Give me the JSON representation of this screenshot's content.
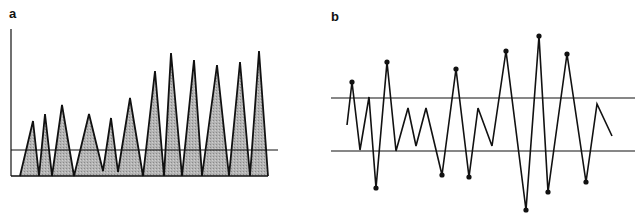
{
  "chart_data": [
    {
      "type": "area",
      "panel_label": "a",
      "title": "",
      "xlabel": "",
      "ylabel": "",
      "grid": false,
      "legend": null,
      "description": "Triangular spikes (shaded) rising from a baseline with a horizontal threshold line; amplitude grows toward the right",
      "ylim": [
        0,
        100
      ],
      "threshold": 18,
      "points": [
        [
          0,
          0
        ],
        [
          9,
          30
        ],
        [
          14,
          0
        ],
        [
          19,
          35
        ],
        [
          24,
          0
        ],
        [
          31,
          41
        ],
        [
          40,
          0
        ],
        [
          52,
          35
        ],
        [
          61,
          3
        ],
        [
          66,
          40
        ],
        [
          73,
          2
        ],
        [
          80,
          53
        ],
        [
          91,
          0
        ],
        [
          101,
          71
        ],
        [
          107,
          0
        ],
        [
          116,
          84
        ],
        [
          124,
          0
        ],
        [
          132,
          79
        ],
        [
          142,
          0
        ],
        [
          152,
          76
        ],
        [
          162,
          0
        ],
        [
          172,
          78
        ],
        [
          180,
          0
        ],
        [
          188,
          85
        ],
        [
          192,
          0
        ]
      ],
      "peaks": [
        30,
        35,
        41,
        35,
        40,
        53,
        71,
        84,
        79,
        76,
        78,
        85
      ],
      "pixel_geometry": {
        "axis_x": 11,
        "axis_top": 29,
        "baseline_y": 176,
        "threshold_y": 150,
        "threshold_x_end": 278,
        "fill_color": "#a9a9a9",
        "stroke_color": "#111111",
        "polyline": [
          [
            20,
            176
          ],
          [
            33,
            121
          ],
          [
            39,
            176
          ],
          [
            45,
            114
          ],
          [
            52,
            176
          ],
          [
            62,
            105
          ],
          [
            74,
            176
          ],
          [
            89,
            114
          ],
          [
            103,
            171
          ],
          [
            111,
            118
          ],
          [
            118,
            172
          ],
          [
            130,
            98
          ],
          [
            143,
            176
          ],
          [
            155,
            71
          ],
          [
            164,
            176
          ],
          [
            171,
            53
          ],
          [
            182,
            176
          ],
          [
            194,
            60
          ],
          [
            202,
            176
          ],
          [
            217,
            65
          ],
          [
            229,
            176
          ],
          [
            240,
            62
          ],
          [
            250,
            176
          ],
          [
            259,
            51
          ],
          [
            268,
            176
          ]
        ]
      }
    },
    {
      "type": "line",
      "panel_label": "b",
      "title": "",
      "xlabel": "",
      "ylabel": "",
      "grid": false,
      "legend": null,
      "description": "Zig-zag signal between two horizontal control limits; points exceeding the limits are marked with dots",
      "ylim": [
        -50,
        50
      ],
      "upper_limit": 10,
      "lower_limit": -10,
      "values": [
        0,
        16,
        -10,
        10,
        -24,
        24,
        -10,
        6,
        -8,
        6,
        -19,
        21,
        -20,
        6,
        -8,
        28,
        -32,
        34,
        -25,
        27,
        -21,
        8,
        -4
      ],
      "marked_outliers": [
        1,
        4,
        5,
        10,
        11,
        12,
        15,
        16,
        17,
        18,
        19,
        20
      ],
      "pixel_geometry": {
        "line_x_start": 331,
        "line_x_end": 635,
        "upper_y": 98,
        "lower_y": 151,
        "stroke_color": "#111111",
        "polyline": [
          [
            347,
            125
          ],
          [
            352,
            82
          ],
          [
            360,
            150
          ],
          [
            369,
            97
          ],
          [
            376,
            188
          ],
          [
            387,
            62
          ],
          [
            396,
            151
          ],
          [
            408,
            108
          ],
          [
            416,
            146
          ],
          [
            426,
            108
          ],
          [
            442,
            175
          ],
          [
            456,
            69
          ],
          [
            469,
            177
          ],
          [
            478,
            108
          ],
          [
            492,
            146
          ],
          [
            506,
            51
          ],
          [
            526,
            210
          ],
          [
            539,
            36
          ],
          [
            548,
            192
          ],
          [
            567,
            54
          ],
          [
            586,
            182
          ],
          [
            597,
            104
          ],
          [
            612,
            136
          ]
        ],
        "dots": [
          [
            352,
            82
          ],
          [
            376,
            188
          ],
          [
            387,
            62
          ],
          [
            442,
            175
          ],
          [
            456,
            69
          ],
          [
            469,
            177
          ],
          [
            506,
            51
          ],
          [
            526,
            210
          ],
          [
            539,
            36
          ],
          [
            548,
            192
          ],
          [
            567,
            54
          ],
          [
            586,
            182
          ]
        ]
      }
    }
  ],
  "labels": {
    "panel_a": "a",
    "panel_b": "b"
  },
  "caption": "Fig. | Signal examples (caption truncated at image edge)"
}
